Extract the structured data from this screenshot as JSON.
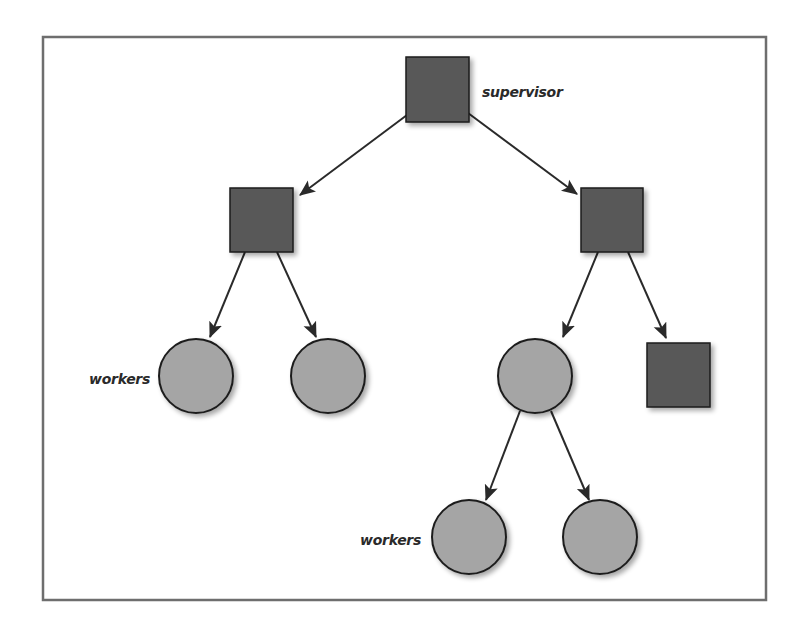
{
  "diagram": {
    "type": "supervision-tree",
    "colors": {
      "frame": "#6e6e6e",
      "supervisor_fill": "#585858",
      "worker_fill": "#a5a5a5",
      "stroke": "#1e1e1e",
      "edge": "#2a2a2a"
    },
    "labels": {
      "supervisor": "supervisor",
      "workers_top": "workers",
      "workers_bottom": "workers"
    },
    "nodes": [
      {
        "id": "root",
        "kind": "supervisor",
        "label": "supervisor"
      },
      {
        "id": "sup-left",
        "kind": "supervisor"
      },
      {
        "id": "sup-right",
        "kind": "supervisor"
      },
      {
        "id": "worker-1",
        "kind": "worker",
        "label": "workers"
      },
      {
        "id": "worker-2",
        "kind": "worker"
      },
      {
        "id": "worker-3",
        "kind": "worker"
      },
      {
        "id": "sup-leaf",
        "kind": "supervisor"
      },
      {
        "id": "worker-4",
        "kind": "worker",
        "label": "workers"
      },
      {
        "id": "worker-5",
        "kind": "worker"
      }
    ],
    "edges": [
      [
        "root",
        "sup-left"
      ],
      [
        "root",
        "sup-right"
      ],
      [
        "sup-left",
        "worker-1"
      ],
      [
        "sup-left",
        "worker-2"
      ],
      [
        "sup-right",
        "worker-3"
      ],
      [
        "sup-right",
        "sup-leaf"
      ],
      [
        "worker-3",
        "worker-4"
      ],
      [
        "worker-3",
        "worker-5"
      ]
    ]
  }
}
